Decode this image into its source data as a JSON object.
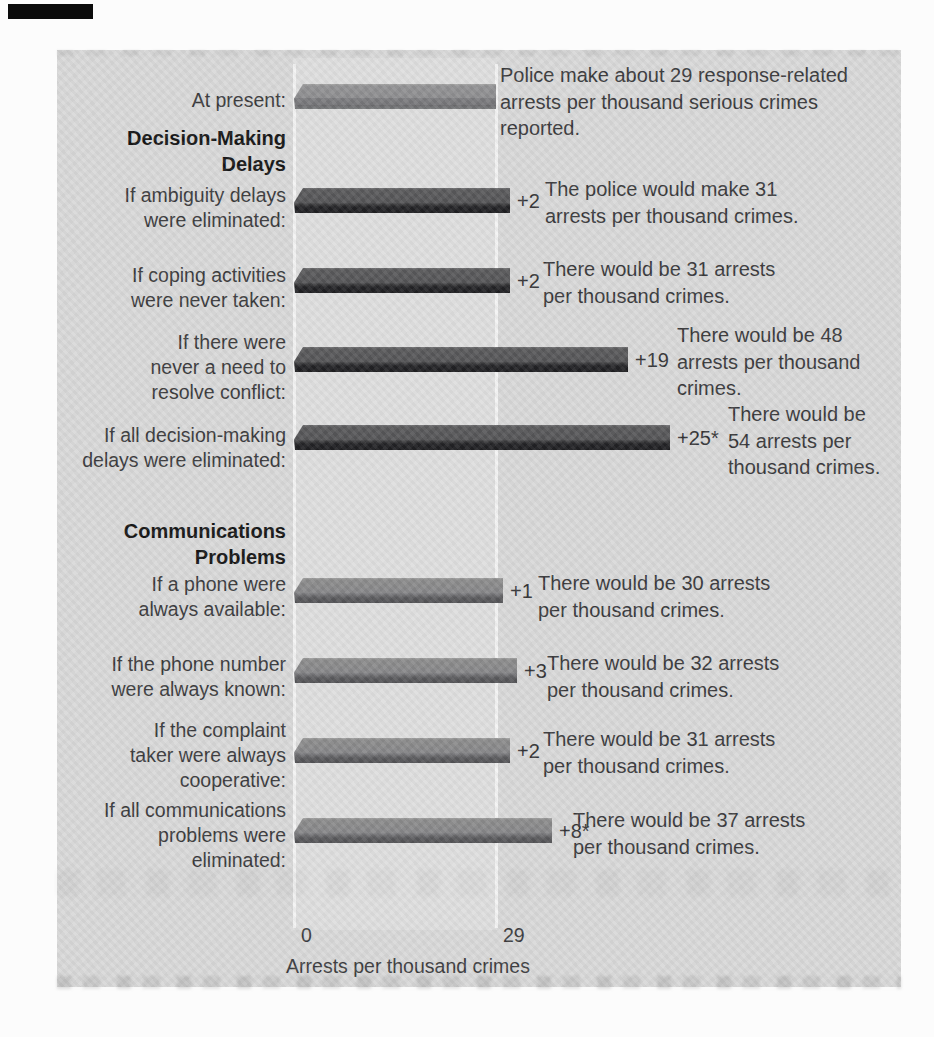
{
  "chart_data": {
    "type": "bar",
    "orientation": "horizontal",
    "xlabel": "Arrests per thousand crimes",
    "x_ticks": [
      "0",
      "29"
    ],
    "baseline_value": 29,
    "grid": "vertical lines at 0 and 29 only",
    "legend": "none",
    "colors": {
      "panel_background": "#d8d8d8",
      "plot_column": "#dedede",
      "gridline": "#f3f3f3",
      "baseline_bar": "#8d8d8f",
      "decision_bars": "#545456",
      "communications_bars": "#868688"
    },
    "sections": [
      {
        "title": "Decision-Making\nDelays"
      },
      {
        "title": "Communications\nProblems"
      }
    ],
    "rows": [
      {
        "label": "At present:",
        "value": 29,
        "delta": null,
        "delta_label": "",
        "series": "baseline",
        "annotation": "Police make about 29 response-related\narrests per thousand serious crimes\nreported."
      },
      {
        "label": "If ambiguity delays\nwere eliminated:",
        "value": 31,
        "delta": 2,
        "delta_label": "+2",
        "series": "decision",
        "annotation": "The police would make 31\narrests per thousand crimes."
      },
      {
        "label": "If coping activities\nwere never taken:",
        "value": 31,
        "delta": 2,
        "delta_label": "+2",
        "series": "decision",
        "annotation": "There would be 31 arrests\nper thousand crimes."
      },
      {
        "label": "If there were\nnever a need to\nresolve conflict:",
        "value": 48,
        "delta": 19,
        "delta_label": "+19",
        "series": "decision",
        "annotation": "There would be 48\narrests per thousand\ncrimes."
      },
      {
        "label": "If all decision-making\ndelays were eliminated:",
        "value": 54,
        "delta": 25,
        "delta_label": "+25*",
        "series": "decision",
        "annotation": "There would be\n54 arrests per\nthousand crimes."
      },
      {
        "label": "If a phone were\nalways available:",
        "value": 30,
        "delta": 1,
        "delta_label": "+1",
        "series": "communications",
        "annotation": "There would be 30 arrests\nper thousand crimes."
      },
      {
        "label": "If the phone number\nwere always known:",
        "value": 32,
        "delta": 3,
        "delta_label": "+3",
        "series": "communications",
        "annotation": "There would be 32 arrests\nper thousand crimes."
      },
      {
        "label": "If the complaint\ntaker were always\ncooperative:",
        "value": 31,
        "delta": 2,
        "delta_label": "+2",
        "series": "communications",
        "annotation": "There would be 31 arrests\nper thousand crimes."
      },
      {
        "label": "If all communications\nproblems were\neliminated:",
        "value": 37,
        "delta": 8,
        "delta_label": "+8*",
        "series": "communications",
        "annotation": "There would be 37 arrests\nper thousand crimes."
      }
    ]
  }
}
